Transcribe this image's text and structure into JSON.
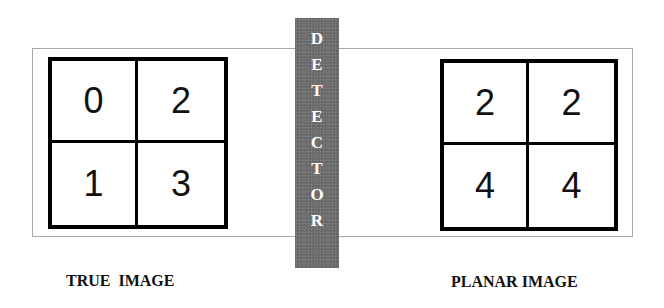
{
  "true_image": {
    "caption": "TRUE  IMAGE",
    "cells": [
      "0",
      "2",
      "1",
      "3"
    ]
  },
  "planar_image": {
    "caption": "PLANAR IMAGE",
    "cells": [
      "2",
      "2",
      "4",
      "4"
    ]
  },
  "detector": {
    "label": "DETECTOR",
    "letters": [
      "D",
      "E",
      "T",
      "E",
      "C",
      "T",
      "O",
      "R"
    ],
    "color": "#6e6e6e"
  }
}
